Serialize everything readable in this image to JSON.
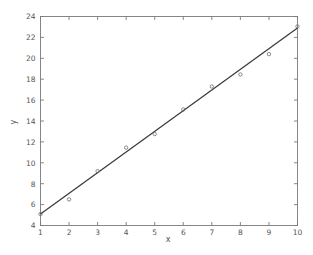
{
  "chart_data": {
    "type": "scatter",
    "title": "",
    "subtitle": "",
    "xlabel": "x",
    "ylabel": "y",
    "xlim": [
      1,
      10
    ],
    "ylim": [
      4,
      24
    ],
    "xticks": [
      1,
      2,
      3,
      4,
      5,
      6,
      7,
      8,
      9,
      10
    ],
    "yticks": [
      4,
      6,
      8,
      10,
      12,
      14,
      16,
      18,
      20,
      22,
      24
    ],
    "xtick_labels": [
      "1",
      "2",
      "3",
      "4",
      "5",
      "6",
      "7",
      "8",
      "9",
      "10"
    ],
    "ytick_labels": [
      "4",
      "6",
      "8",
      "10",
      "12",
      "14",
      "16",
      "18",
      "20",
      "22",
      "24"
    ],
    "grid": false,
    "legend": null,
    "legend_position": "none",
    "annotations": [],
    "series": [
      {
        "name": "data points",
        "type": "scatter",
        "marker": "circle",
        "marker_color": "#6d6d6d",
        "x": [
          1,
          2,
          3,
          4,
          5,
          6,
          7,
          8,
          9,
          10
        ],
        "y": [
          5.1,
          6.5,
          9.2,
          11.45,
          12.75,
          15.1,
          17.3,
          18.45,
          20.4,
          23.05
        ]
      },
      {
        "name": "fitted line",
        "type": "line",
        "color": "#3a3a3a",
        "x": [
          1,
          10
        ],
        "y": [
          5.1,
          22.9
        ]
      }
    ]
  },
  "figure": {
    "background_color": "#ffffff",
    "axis_color": "#7a7a7a",
    "line_color": "#3a3a3a",
    "marker_color": "#6d6d6d"
  }
}
